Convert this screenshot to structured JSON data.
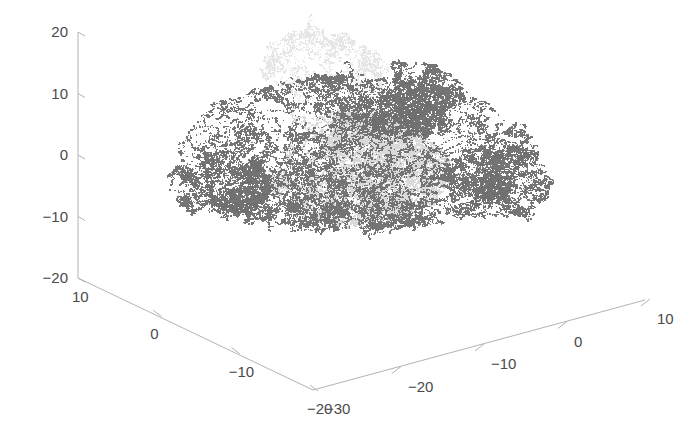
{
  "figure": {
    "width": 681,
    "height": 439,
    "background": "#ffffff",
    "axis_color": "#b3b3b3",
    "label_color": "#4a4a4a"
  },
  "chart_data": {
    "type": "scatter",
    "projection": "3d",
    "title": "",
    "xlabel": "",
    "ylabel": "",
    "zlabel": "",
    "grid": false,
    "legend": null,
    "background": "#ffffff",
    "axes": {
      "z_axis": {
        "name": "z-axis",
        "orientation": "vertical-left",
        "ticks": [
          20,
          10,
          0,
          -10,
          -20
        ],
        "tick_labels": [
          "20",
          "10",
          "0",
          "-10",
          "-20"
        ],
        "range": [
          -20,
          20
        ]
      },
      "x_axis": {
        "name": "x-axis",
        "orientation": "bottom-left-descending",
        "ticks": [
          10,
          0,
          -10,
          -20
        ],
        "tick_labels": [
          "10",
          "0",
          "-10",
          "-20"
        ],
        "range": [
          -20,
          10
        ]
      },
      "y_axis": {
        "name": "y-axis",
        "orientation": "bottom-right-ascending",
        "ticks": [
          -30,
          -20,
          -10,
          0,
          10
        ],
        "tick_labels": [
          "-30",
          "-20",
          "-10",
          "0",
          "10"
        ],
        "range": [
          -30,
          10
        ]
      }
    },
    "series": [
      {
        "name": "dark-walk",
        "color": "#6e6e6e",
        "marker": "point",
        "point_count": 20000,
        "description": "dark gray fractal random-walk cloud spanning the full width"
      },
      {
        "name": "light-walk",
        "color": "#d2d2d2",
        "marker": "point",
        "point_count": 16000,
        "description": "light gray fractal random-walk cloud concentrated centrally with a faint upward tail"
      }
    ]
  },
  "tick_labels": {
    "z": [
      "20",
      "10",
      "0",
      "-10",
      "-20"
    ],
    "x": [
      "10",
      "0",
      "-10",
      "-20"
    ],
    "y": [
      "-30",
      "-20",
      "-10",
      "0",
      "10"
    ]
  }
}
